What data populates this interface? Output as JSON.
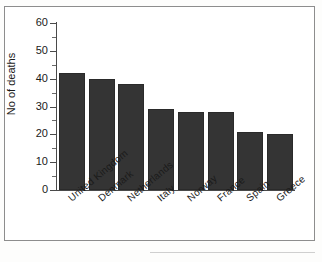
{
  "chart_data": {
    "type": "bar",
    "title": "",
    "xlabel": "",
    "ylabel": "No of deaths",
    "ylim": [
      0,
      60
    ],
    "ytick_step": 10,
    "yminor_step": 5,
    "grid": false,
    "legend": false,
    "bar_color": "#343434",
    "axis_color": "#4a4a4a",
    "categories": [
      "United Kingdom",
      "Denmark",
      "Netherlands",
      "Italy",
      "Norway",
      "France",
      "Spain",
      "Greece"
    ],
    "values": [
      42,
      40,
      38,
      29,
      28,
      28,
      21,
      20
    ],
    "ytick_labels": [
      "0",
      "10",
      "20",
      "30",
      "40",
      "50",
      "60"
    ]
  }
}
